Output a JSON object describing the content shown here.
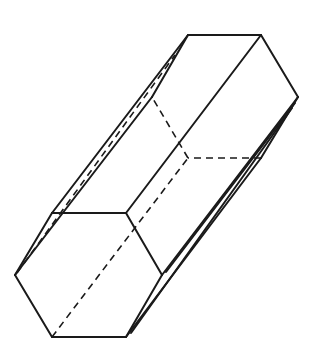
{
  "diagram": {
    "type": "hexagonal-prism",
    "colors": {
      "background": "#ffffff",
      "stroke": "#1a1a1a"
    },
    "front_face": {
      "vertices": [
        [
          52,
          213
        ],
        [
          126,
          213
        ],
        [
          162,
          275
        ],
        [
          126,
          337
        ],
        [
          52,
          337
        ],
        [
          15,
          275
        ]
      ]
    },
    "back_face": {
      "vertices": [
        [
          188,
          35
        ],
        [
          261,
          35
        ],
        [
          298,
          97
        ],
        [
          261,
          158
        ],
        [
          188,
          158
        ],
        [
          152,
          97
        ]
      ]
    },
    "visible_edges": [
      [
        [
          52,
          213
        ],
        [
          126,
          213
        ]
      ],
      [
        [
          126,
          213
        ],
        [
          162,
          275
        ]
      ],
      [
        [
          162,
          275
        ],
        [
          126,
          337
        ]
      ],
      [
        [
          126,
          337
        ],
        [
          52,
          337
        ]
      ],
      [
        [
          52,
          337
        ],
        [
          15,
          275
        ]
      ],
      [
        [
          15,
          275
        ],
        [
          52,
          213
        ]
      ],
      [
        [
          188,
          35
        ],
        [
          261,
          35
        ]
      ],
      [
        [
          261,
          35
        ],
        [
          298,
          97
        ]
      ],
      [
        [
          298,
          97
        ],
        [
          261,
          158
        ]
      ],
      [
        [
          52,
          213
        ],
        [
          188,
          35
        ]
      ],
      [
        [
          126,
          213
        ],
        [
          261,
          35
        ]
      ],
      [
        [
          162,
          275
        ],
        [
          298,
          97
        ]
      ],
      [
        [
          126,
          337
        ],
        [
          261,
          158
        ]
      ],
      [
        [
          15,
          275
        ],
        [
          152,
          97
        ]
      ],
      [
        [
          152,
          97
        ],
        [
          188,
          35
        ]
      ]
    ],
    "hidden_edges": [
      [
        [
          261,
          158
        ],
        [
          188,
          158
        ]
      ],
      [
        [
          188,
          158
        ],
        [
          152,
          97
        ]
      ],
      [
        [
          52,
          337
        ],
        [
          188,
          158
        ]
      ],
      [
        [
          17,
          273
        ],
        [
          175,
          55
        ]
      ]
    ]
  }
}
